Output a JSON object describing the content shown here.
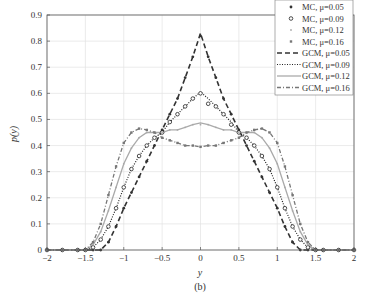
{
  "chart_data": {
    "type": "line",
    "title": "",
    "caption": "(b)",
    "xlabel": "y",
    "ylabel": "p(y)",
    "xlim": [
      -2,
      2
    ],
    "ylim": [
      0,
      0.9
    ],
    "xticks": [
      -2,
      -1.5,
      -1,
      -0.5,
      0,
      0.5,
      1,
      1.5,
      2
    ],
    "xtick_labels": [
      "−2",
      "−1.5",
      "−1",
      "−0.5",
      "0",
      "0.5",
      "1",
      "1.5",
      "2"
    ],
    "yticks": [
      0,
      0.1,
      0.2,
      0.3,
      0.4,
      0.5,
      0.6,
      0.7,
      0.8,
      0.9
    ],
    "ytick_labels": [
      "0",
      "0.1",
      "0.2",
      "0.3",
      "0.4",
      "0.5",
      "0.6",
      "0.7",
      "0.8",
      "0.9"
    ],
    "grid": true,
    "legend_position": "upper right",
    "x": [
      -2.0,
      -1.8,
      -1.6,
      -1.5,
      -1.4,
      -1.3,
      -1.2,
      -1.1,
      -1.0,
      -0.9,
      -0.8,
      -0.7,
      -0.6,
      -0.5,
      -0.4,
      -0.3,
      -0.2,
      -0.1,
      0.0,
      0.1,
      0.2,
      0.3,
      0.4,
      0.5,
      0.6,
      0.7,
      0.8,
      0.9,
      1.0,
      1.1,
      1.2,
      1.3,
      1.4,
      1.5,
      1.6,
      1.8,
      2.0
    ],
    "series": [
      {
        "name": "MC, μ=0.05",
        "kind": "markers",
        "marker": "star",
        "values": [
          0,
          0,
          0,
          0,
          0,
          0,
          0.03,
          0.09,
          0.16,
          0.22,
          0.28,
          0.34,
          0.4,
          0.46,
          0.52,
          0.58,
          0.66,
          0.74,
          0.82,
          0.74,
          0.66,
          0.58,
          0.52,
          0.46,
          0.4,
          0.34,
          0.28,
          0.22,
          0.16,
          0.09,
          0.03,
          0,
          0,
          0,
          0,
          0,
          0
        ]
      },
      {
        "name": "MC, μ=0.09",
        "kind": "markers",
        "marker": "diamond",
        "values": [
          0,
          0,
          0,
          0,
          0.01,
          0.04,
          0.09,
          0.16,
          0.24,
          0.31,
          0.36,
          0.4,
          0.43,
          0.45,
          0.49,
          0.52,
          0.55,
          0.58,
          0.6,
          0.56,
          0.55,
          0.52,
          0.48,
          0.45,
          0.43,
          0.4,
          0.36,
          0.31,
          0.24,
          0.16,
          0.09,
          0.04,
          0.01,
          0,
          0,
          0,
          0
        ]
      },
      {
        "name": "MC, μ=0.12",
        "kind": "markers",
        "marker": "dot",
        "values": [
          0,
          0,
          0,
          0,
          0.02,
          0.07,
          0.15,
          0.24,
          0.33,
          0.39,
          0.43,
          0.45,
          0.45,
          0.45,
          0.46,
          0.46,
          0.47,
          0.48,
          0.48,
          0.48,
          0.47,
          0.46,
          0.46,
          0.45,
          0.45,
          0.45,
          0.43,
          0.39,
          0.33,
          0.24,
          0.15,
          0.07,
          0.02,
          0,
          0,
          0,
          0
        ]
      },
      {
        "name": "MC, μ=0.16",
        "kind": "markers",
        "marker": "square",
        "values": [
          0,
          0,
          0,
          0,
          0.03,
          0.1,
          0.21,
          0.32,
          0.41,
          0.45,
          0.465,
          0.46,
          0.45,
          0.43,
          0.42,
          0.41,
          0.4,
          0.4,
          0.395,
          0.4,
          0.4,
          0.41,
          0.42,
          0.43,
          0.45,
          0.46,
          0.465,
          0.45,
          0.41,
          0.32,
          0.21,
          0.1,
          0.03,
          0,
          0,
          0,
          0
        ]
      },
      {
        "name": "GCM, μ=0.05",
        "kind": "line",
        "style": "dashed",
        "values": [
          0,
          0,
          0,
          0,
          0,
          0,
          0.03,
          0.09,
          0.16,
          0.22,
          0.28,
          0.34,
          0.4,
          0.46,
          0.52,
          0.58,
          0.66,
          0.74,
          0.83,
          0.74,
          0.66,
          0.58,
          0.52,
          0.46,
          0.4,
          0.34,
          0.28,
          0.22,
          0.16,
          0.09,
          0.03,
          0,
          0,
          0,
          0,
          0,
          0
        ]
      },
      {
        "name": "GCM, μ=0.09",
        "kind": "line",
        "style": "dotted",
        "values": [
          0,
          0,
          0,
          0,
          0.01,
          0.04,
          0.09,
          0.16,
          0.24,
          0.31,
          0.36,
          0.4,
          0.43,
          0.45,
          0.49,
          0.52,
          0.55,
          0.58,
          0.605,
          0.58,
          0.55,
          0.52,
          0.49,
          0.45,
          0.43,
          0.4,
          0.36,
          0.31,
          0.24,
          0.16,
          0.09,
          0.04,
          0.01,
          0,
          0,
          0,
          0
        ]
      },
      {
        "name": "GCM, μ=0.12",
        "kind": "line",
        "style": "solid",
        "values": [
          0,
          0,
          0,
          0,
          0.02,
          0.07,
          0.15,
          0.24,
          0.33,
          0.39,
          0.43,
          0.45,
          0.45,
          0.45,
          0.46,
          0.46,
          0.47,
          0.48,
          0.487,
          0.48,
          0.47,
          0.46,
          0.46,
          0.45,
          0.45,
          0.45,
          0.43,
          0.39,
          0.33,
          0.24,
          0.15,
          0.07,
          0.02,
          0,
          0,
          0,
          0
        ]
      },
      {
        "name": "GCM, μ=0.16",
        "kind": "line",
        "style": "dashdot",
        "values": [
          0,
          0,
          0,
          0,
          0.03,
          0.1,
          0.21,
          0.32,
          0.41,
          0.45,
          0.465,
          0.46,
          0.45,
          0.43,
          0.42,
          0.41,
          0.4,
          0.4,
          0.395,
          0.4,
          0.4,
          0.41,
          0.42,
          0.43,
          0.45,
          0.46,
          0.465,
          0.45,
          0.41,
          0.32,
          0.21,
          0.1,
          0.03,
          0,
          0,
          0,
          0
        ]
      }
    ]
  },
  "colors": {
    "mu_005": "#333333",
    "mu_009": "#222222",
    "mu_012": "#aaaaaa",
    "mu_016": "#777777",
    "grid": "#e3e3e3",
    "axis": "#555555"
  }
}
